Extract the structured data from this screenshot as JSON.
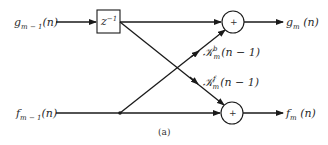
{
  "diagram": {
    "caption": "(a)",
    "inputs": {
      "top": {
        "base": "g",
        "sub": "m − 1",
        "arg": "(n)"
      },
      "bottom": {
        "base": "f",
        "sub": "m − 1",
        "arg": "(n)"
      }
    },
    "outputs": {
      "top": {
        "base": "g",
        "sub": "m",
        "arg": " (n)"
      },
      "bottom": {
        "base": "f",
        "sub": "m",
        "arg": " (n)"
      }
    },
    "delay": {
      "base": "z",
      "sup": "−1"
    },
    "adders": {
      "top": "+",
      "bottom": "+"
    },
    "gains": {
      "backward": {
        "base": "𝒦",
        "sup": "b",
        "sub": "m",
        "arg": "(n − 1)"
      },
      "forward": {
        "base": "𝒦",
        "sup": "f",
        "sub": "m",
        "arg": "(n − 1)"
      }
    },
    "colors": {
      "line": "#1a1a1a",
      "text": "#2a2a2a",
      "background": "#ffffff"
    }
  }
}
